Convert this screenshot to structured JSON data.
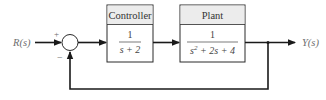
{
  "diagram": {
    "input_label": "R(s)",
    "output_label": "Y(s)",
    "summing_junction": {
      "plus_sign": "+",
      "minus_sign": "−"
    },
    "controller": {
      "title": "Controller",
      "numerator": "1",
      "denominator": "s + 2"
    },
    "plant": {
      "title": "Plant",
      "numerator": "1",
      "denominator_base": "s",
      "denominator_exp": "2",
      "denominator_rest": " + 2s + 4"
    },
    "feedback": "unity negative feedback",
    "colors": {
      "line": "#1a1a1a",
      "box_border": "#2a2a2a",
      "box_header_fill": "#ececec",
      "label_text": "#6e6e6e"
    }
  }
}
